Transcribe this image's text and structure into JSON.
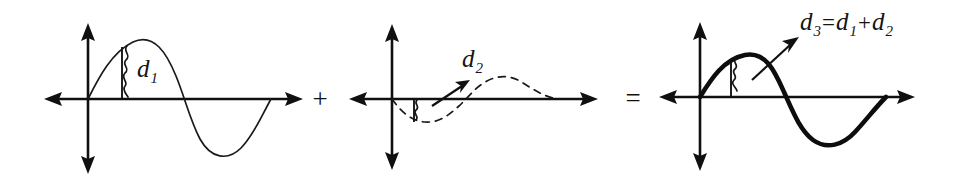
{
  "figure": {
    "background_color": "#ffffff",
    "ink_color": "#111111",
    "width": 967,
    "height": 191,
    "operators": [
      {
        "name": "plus",
        "symbol": "+",
        "x": 320,
        "y": 107
      },
      {
        "name": "equals",
        "symbol": "=",
        "x": 628,
        "y": 106
      }
    ],
    "panels": [
      {
        "id": "panel-1",
        "role": "first-wave",
        "label": "d",
        "label_subscript": "1",
        "label_full": "d1",
        "wave_style": "thin-solid",
        "amplitude_px": 58,
        "origin_x": 88,
        "axis_y": 99
      },
      {
        "id": "panel-2",
        "role": "second-wave",
        "label": "d",
        "label_subscript": "2",
        "label_full": "d2",
        "wave_style": "dashed",
        "amplitude_px": 23,
        "origin_x": 392,
        "axis_y": 99,
        "has_pointer_arrow": true
      },
      {
        "id": "panel-3",
        "role": "sum-wave",
        "label": "d",
        "label_subscript": "3",
        "label_equals": "=",
        "label_term1": "d",
        "label_term1_sub": "1",
        "label_plus": "+",
        "label_term2": "d",
        "label_term2_sub": "2",
        "label_full": "d3=d1+d2",
        "wave_style": "bold-solid",
        "amplitude_px": 44,
        "origin_x": 700,
        "axis_y": 97,
        "has_pointer_arrow": true
      }
    ]
  }
}
